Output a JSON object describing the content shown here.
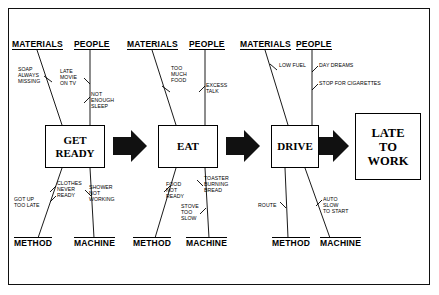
{
  "diagram": {
    "type": "fishbone-cause-and-effect",
    "frame_color": "#111111",
    "ink_color": "#000000",
    "background": "#ffffff"
  },
  "stages": [
    {
      "id": "get-ready",
      "label": "GET\nREADY",
      "categories": {
        "materials": "MATERIALS",
        "people": "PEOPLE",
        "method": "METHOD",
        "machine": "MACHINE"
      },
      "causes": {
        "materials": [
          "SOAP\nALWAYS\nMISSING"
        ],
        "people": [
          "LATE\nMOVIE\nON TV",
          "NOT\nENOUGH\nSLEEP"
        ],
        "method": [
          "GOT UP\nTOO LATE",
          "CLOTHES\nNEVER\nREADY"
        ],
        "machine": [
          "SHOWER\nNOT\nWORKING"
        ]
      }
    },
    {
      "id": "eat",
      "label": "EAT",
      "categories": {
        "materials": "MATERIALS",
        "people": "PEOPLE",
        "method": "METHOD",
        "machine": "MACHINE"
      },
      "causes": {
        "materials": [
          "TOO\nMUCH\nFOOD"
        ],
        "people": [
          "EXCESS\nTALK"
        ],
        "method": [
          "FOOD\nNOT\nREADY"
        ],
        "machine": [
          "TOASTER\nBURNING\nBREAD",
          "STOVE\nTOO\nSLOW"
        ]
      }
    },
    {
      "id": "drive",
      "label": "DRIVE",
      "categories": {
        "materials": "MATERIALS",
        "people": "PEOPLE",
        "method": "METHOD",
        "machine": "MACHINE"
      },
      "causes": {
        "materials": [
          "LOW FUEL"
        ],
        "people": [
          "DAY DREAMS",
          "STOP FOR CIGARETTES"
        ],
        "method": [
          "ROUTE"
        ],
        "machine": [
          "AUTO\nSLOW\nTO START"
        ]
      }
    }
  ],
  "result": {
    "label": "LATE\nTO\nWORK"
  },
  "arrows": [
    {
      "id": "arrow-get-ready-to-eat"
    },
    {
      "id": "arrow-eat-to-drive"
    },
    {
      "id": "arrow-drive-to-result"
    }
  ]
}
